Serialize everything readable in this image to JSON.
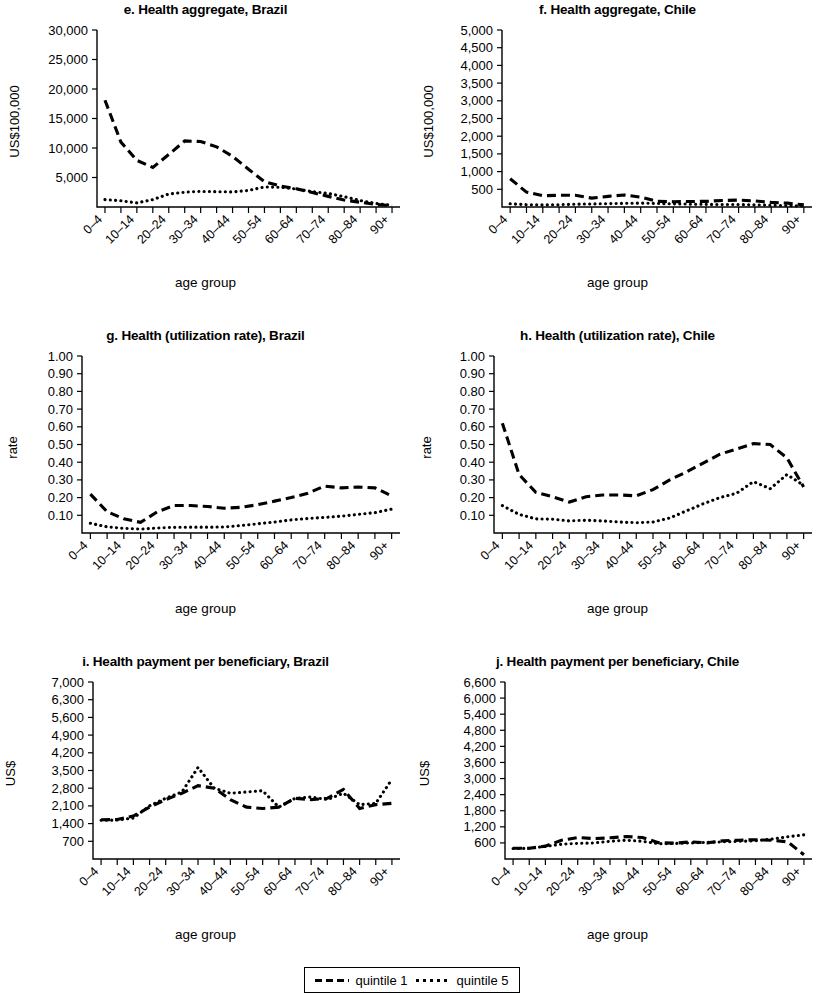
{
  "figure": {
    "xlabel": "age group",
    "categories": [
      "0–4",
      "5–9",
      "10–14",
      "15–19",
      "20–24",
      "25–29",
      "30–34",
      "35–39",
      "40–44",
      "45–49",
      "50–54",
      "55–59",
      "60–64",
      "65–69",
      "70–74",
      "75–79",
      "80–84",
      "85–89",
      "90+"
    ],
    "tick_labels": [
      "0–4",
      "10–14",
      "20–24",
      "30–34",
      "40–44",
      "50–54",
      "60–64",
      "70–74",
      "80–84",
      "90+"
    ]
  },
  "legend": {
    "items": [
      {
        "label": "quintile 1",
        "style": "dashed"
      },
      {
        "label": "quintile 5",
        "style": "dotted"
      }
    ]
  },
  "chart_data": [
    {
      "id": "e",
      "type": "line",
      "title": "e. Health aggregate, Brazil",
      "xlabel": "age group",
      "ylabel": "US$100,000",
      "ylim": [
        0,
        30000
      ],
      "yticks": [
        5000,
        10000,
        15000,
        20000,
        25000,
        30000
      ],
      "ytick_labels": [
        "5,000",
        "10,000",
        "15,000",
        "20,000",
        "25,000",
        "30,000"
      ],
      "grid": false,
      "legend_position": "bottom-shared",
      "x": [
        "0–4",
        "5–9",
        "10–14",
        "15–19",
        "20–24",
        "25–29",
        "30–34",
        "35–39",
        "40–44",
        "45–49",
        "50–54",
        "55–59",
        "60–64",
        "65–69",
        "70–74",
        "75–79",
        "80–84",
        "85–89",
        "90+"
      ],
      "series": [
        {
          "name": "quintile 1",
          "style": "dashed",
          "values": [
            18100,
            11000,
            7900,
            6700,
            8900,
            11200,
            11100,
            10200,
            8600,
            6400,
            4300,
            3550,
            3100,
            2450,
            1800,
            1180,
            800,
            430,
            250
          ]
        },
        {
          "name": "quintile 5",
          "style": "dotted",
          "values": [
            1250,
            1050,
            700,
            1250,
            2200,
            2500,
            2650,
            2600,
            2550,
            2800,
            3400,
            3350,
            3050,
            2600,
            2300,
            1750,
            1100,
            600,
            280
          ]
        }
      ]
    },
    {
      "id": "f",
      "type": "line",
      "title": "f. Health aggregate, Chile",
      "xlabel": "age group",
      "ylabel": "US$100,000",
      "ylim": [
        0,
        5000
      ],
      "yticks": [
        500,
        1000,
        1500,
        2000,
        2500,
        3000,
        3500,
        4000,
        4500,
        5000
      ],
      "ytick_labels": [
        "500",
        "1,000",
        "1,500",
        "2,000",
        "2,500",
        "3,000",
        "3,500",
        "4,000",
        "4,500",
        "5,000"
      ],
      "grid": false,
      "legend_position": "bottom-shared",
      "x": [
        "0–4",
        "5–9",
        "10–14",
        "15–19",
        "20–24",
        "25–29",
        "30–34",
        "35–39",
        "40–44",
        "45–49",
        "50–54",
        "55–59",
        "60–64",
        "65–69",
        "70–74",
        "75–79",
        "80–84",
        "85–89",
        "90+"
      ],
      "series": [
        {
          "name": "quintile 1",
          "style": "dashed",
          "values": [
            800,
            420,
            320,
            330,
            330,
            250,
            300,
            340,
            280,
            160,
            150,
            155,
            160,
            185,
            195,
            170,
            130,
            110,
            60
          ]
        },
        {
          "name": "quintile 5",
          "style": "dotted",
          "values": [
            90,
            65,
            60,
            65,
            80,
            85,
            95,
            105,
            110,
            100,
            90,
            80,
            75,
            70,
            70,
            60,
            50,
            40,
            25
          ]
        }
      ]
    },
    {
      "id": "g",
      "type": "line",
      "title": "g. Health (utilization rate), Brazil",
      "xlabel": "age group",
      "ylabel": "rate",
      "ylim": [
        0,
        1.0
      ],
      "yticks": [
        0.1,
        0.2,
        0.3,
        0.4,
        0.5,
        0.6,
        0.7,
        0.8,
        0.9,
        1.0
      ],
      "ytick_labels": [
        "0.10",
        "0.20",
        "0.30",
        "0.40",
        "0.50",
        "0.60",
        "0.70",
        "0.80",
        "0.90",
        "1.00"
      ],
      "grid": false,
      "legend_position": "bottom-shared",
      "x": [
        "0–4",
        "5–9",
        "10–14",
        "15–19",
        "20–24",
        "25–29",
        "30–34",
        "35–39",
        "40–44",
        "45–49",
        "50–54",
        "55–59",
        "60–64",
        "65–69",
        "70–74",
        "75–79",
        "80–84",
        "85–89",
        "90+"
      ],
      "series": [
        {
          "name": "quintile 1",
          "style": "dashed",
          "values": [
            0.22,
            0.12,
            0.08,
            0.06,
            0.12,
            0.155,
            0.155,
            0.15,
            0.14,
            0.145,
            0.16,
            0.18,
            0.2,
            0.225,
            0.265,
            0.255,
            0.26,
            0.255,
            0.21
          ]
        },
        {
          "name": "quintile 5",
          "style": "dotted",
          "values": [
            0.055,
            0.035,
            0.026,
            0.022,
            0.028,
            0.032,
            0.033,
            0.033,
            0.034,
            0.042,
            0.052,
            0.062,
            0.074,
            0.082,
            0.088,
            0.095,
            0.105,
            0.115,
            0.135
          ]
        }
      ]
    },
    {
      "id": "h",
      "type": "line",
      "title": "h. Health (utilization rate), Chile",
      "xlabel": "age group",
      "ylabel": "rate",
      "ylim": [
        0,
        1.0
      ],
      "yticks": [
        0.1,
        0.2,
        0.3,
        0.4,
        0.5,
        0.6,
        0.7,
        0.8,
        0.9,
        1.0
      ],
      "ytick_labels": [
        "0.10",
        "0.20",
        "0.30",
        "0.40",
        "0.50",
        "0.60",
        "0.70",
        "0.80",
        "0.90",
        "1.00"
      ],
      "grid": false,
      "legend_position": "bottom-shared",
      "x": [
        "0–4",
        "5–9",
        "10–14",
        "15–19",
        "20–24",
        "25–29",
        "30–34",
        "35–39",
        "40–44",
        "45–49",
        "50–54",
        "55–59",
        "60–64",
        "65–69",
        "70–74",
        "75–79",
        "80–84",
        "85–89",
        "90+"
      ],
      "series": [
        {
          "name": "quintile 1",
          "style": "dashed",
          "values": [
            0.62,
            0.33,
            0.23,
            0.205,
            0.175,
            0.205,
            0.215,
            0.215,
            0.21,
            0.245,
            0.3,
            0.345,
            0.395,
            0.445,
            0.475,
            0.505,
            0.5,
            0.425,
            0.26
          ]
        },
        {
          "name": "quintile 5",
          "style": "dotted",
          "values": [
            0.155,
            0.105,
            0.08,
            0.078,
            0.068,
            0.072,
            0.068,
            0.062,
            0.058,
            0.062,
            0.085,
            0.125,
            0.165,
            0.2,
            0.225,
            0.29,
            0.25,
            0.33,
            0.27
          ]
        }
      ]
    },
    {
      "id": "i",
      "type": "line",
      "title": "i. Health payment per beneficiary, Brazil",
      "xlabel": "age group",
      "ylabel": "US$",
      "ylim": [
        0,
        7000
      ],
      "yticks": [
        700,
        1400,
        2100,
        2800,
        3500,
        4200,
        4900,
        5600,
        6300,
        7000
      ],
      "ytick_labels": [
        "700",
        "1,400",
        "2,100",
        "2,800",
        "3,500",
        "4,200",
        "4,900",
        "5,600",
        "6,300",
        "7,000"
      ],
      "grid": false,
      "legend_position": "bottom-shared",
      "x": [
        "0–4",
        "5–9",
        "10–14",
        "15–19",
        "20–24",
        "25–29",
        "30–34",
        "35–39",
        "40–44",
        "45–49",
        "50–54",
        "55–59",
        "60–64",
        "65–69",
        "70–74",
        "75–79",
        "80–84",
        "85–89",
        "90+"
      ],
      "series": [
        {
          "name": "quintile 1",
          "style": "dashed",
          "values": [
            1550,
            1560,
            1700,
            2050,
            2350,
            2600,
            2900,
            2800,
            2350,
            2050,
            2000,
            2050,
            2400,
            2350,
            2400,
            2750,
            2000,
            2150,
            2200
          ]
        },
        {
          "name": "quintile 5",
          "style": "dotted",
          "values": [
            1530,
            1540,
            1620,
            2100,
            2400,
            2650,
            3620,
            2800,
            2600,
            2650,
            2700,
            2050,
            2400,
            2450,
            2350,
            2600,
            2150,
            2200,
            3150
          ]
        }
      ]
    },
    {
      "id": "j",
      "type": "line",
      "title": "j. Health payment per beneficiary, Chile",
      "xlabel": "age group",
      "ylabel": "US$",
      "ylim": [
        0,
        6600
      ],
      "yticks": [
        600,
        1200,
        1800,
        2400,
        3000,
        3600,
        4200,
        4800,
        5400,
        6000,
        6600
      ],
      "ytick_labels": [
        "600",
        "1,200",
        "1,800",
        "2,400",
        "3,000",
        "3,600",
        "4,200",
        "4,800",
        "5,400",
        "6,000",
        "6,600"
      ],
      "grid": false,
      "legend_position": "bottom-shared",
      "x": [
        "0–4",
        "5–9",
        "10–14",
        "15–19",
        "20–24",
        "25–29",
        "30–34",
        "35–39",
        "40–44",
        "45–49",
        "50–54",
        "55–59",
        "60–64",
        "65–69",
        "70–74",
        "75–79",
        "80–84",
        "85–89",
        "90+"
      ],
      "series": [
        {
          "name": "quintile 1",
          "style": "dashed",
          "values": [
            400,
            400,
            480,
            700,
            800,
            760,
            790,
            840,
            800,
            610,
            590,
            640,
            600,
            680,
            700,
            720,
            700,
            640,
            160
          ]
        },
        {
          "name": "quintile 5",
          "style": "dotted",
          "values": [
            390,
            400,
            470,
            550,
            580,
            600,
            660,
            700,
            660,
            570,
            580,
            600,
            620,
            640,
            660,
            680,
            740,
            830,
            900
          ]
        }
      ]
    }
  ]
}
